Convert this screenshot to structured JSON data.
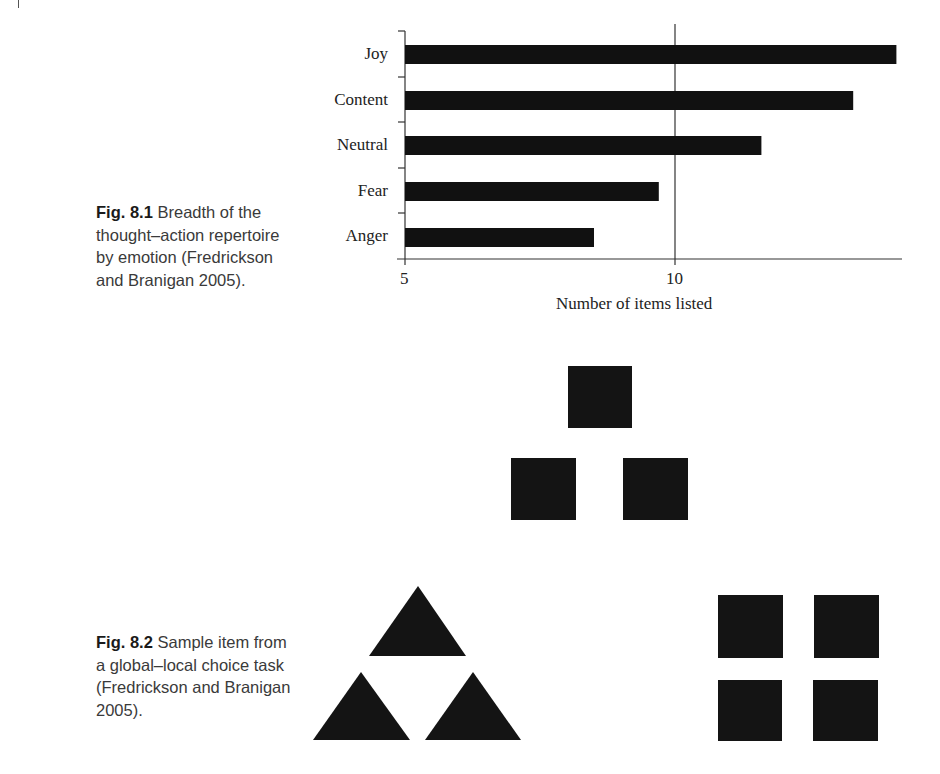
{
  "figure_8_1": {
    "caption_num": "Fig. 8.1",
    "caption_text": "Breadth of the thought–action repertoire by emotion (Fredrickson and Branigan 2005)."
  },
  "figure_8_2": {
    "caption_num": "Fig. 8.2",
    "caption_text": "Sample item from a global–local choice task (Fredrickson and Branigan 2005).",
    "target": "three squares arranged in a triangle",
    "option_global": "three triangles arranged in a triangle",
    "option_local": "four squares arranged in a square"
  },
  "chart_data": {
    "type": "bar",
    "orientation": "horizontal",
    "title": "",
    "categories": [
      "Joy",
      "Content",
      "Neutral",
      "Fear",
      "Anger"
    ],
    "values": [
      14.1,
      13.3,
      11.6,
      9.7,
      8.5
    ],
    "xlabel": "Number of items listed",
    "ylabel": "",
    "xlim": [
      5,
      14.2
    ],
    "xticks": [
      "5",
      "10"
    ],
    "reference_line": 10,
    "grid": false,
    "legend": null,
    "bar_color": "#111111"
  }
}
